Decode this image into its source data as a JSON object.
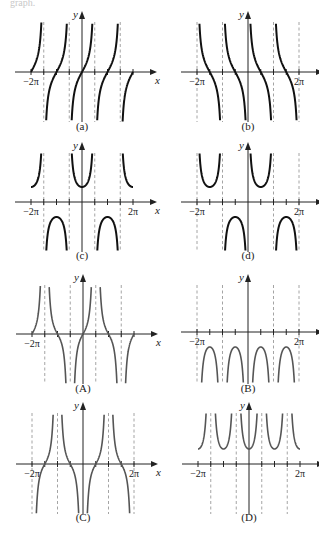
{
  "header_fragment": "graph.",
  "chart_data": [
    {
      "id": "a",
      "type": "line",
      "title": "(a)",
      "function": "tan",
      "xlabel": "x",
      "ylabel": "y",
      "xlim": [
        "-2π",
        "2π"
      ],
      "x_tick_labels": [
        "−2π"
      ],
      "asymptotes": [
        "-3π/2",
        "-π/2",
        "π/2",
        "3π/2"
      ],
      "zeros": [
        "-2π",
        "-π",
        "0",
        "π",
        "2π"
      ],
      "style": "dark"
    },
    {
      "id": "b",
      "type": "line",
      "title": "(b)",
      "function": "cot",
      "xlabel": "x",
      "ylabel": "y",
      "xlim": [
        "-2π",
        "2π"
      ],
      "x_tick_labels": [
        "−2π",
        "2π"
      ],
      "asymptotes": [
        "-2π",
        "-π",
        "0",
        "π",
        "2π"
      ],
      "zeros": [
        "-3π/2",
        "-π/2",
        "π/2",
        "3π/2"
      ],
      "style": "dark"
    },
    {
      "id": "c",
      "type": "line",
      "title": "(c)",
      "function": "sec",
      "xlabel": "x",
      "ylabel": "y",
      "xlim": [
        "-2π",
        "2π"
      ],
      "x_tick_labels": [
        "−2π",
        "2π"
      ],
      "asymptotes": [
        "-3π/2",
        "-π/2",
        "π/2",
        "3π/2"
      ],
      "local_extrema": [
        {
          "x": "0",
          "y": 1
        },
        {
          "x": "-π",
          "y": -1
        },
        {
          "x": "π",
          "y": -1
        },
        {
          "x": "-2π",
          "y": 1
        },
        {
          "x": "2π",
          "y": 1
        }
      ],
      "style": "dark"
    },
    {
      "id": "d",
      "type": "line",
      "title": "(d)",
      "function": "csc",
      "xlabel": "x",
      "ylabel": "y",
      "xlim": [
        "-2π",
        "2π"
      ],
      "x_tick_labels": [
        "−2π",
        "2π"
      ],
      "asymptotes": [
        "-2π",
        "-π",
        "0",
        "π",
        "2π"
      ],
      "local_extrema": [
        {
          "x": "-3π/2",
          "y": 1
        },
        {
          "x": "-π/2",
          "y": -1
        },
        {
          "x": "π/2",
          "y": 1
        },
        {
          "x": "3π/2",
          "y": -1
        }
      ],
      "style": "dark"
    },
    {
      "id": "A",
      "type": "line",
      "title": "(A)",
      "function": "sectan",
      "xlabel": "x",
      "ylabel": "y",
      "xlim": [
        "-2π",
        "2π"
      ],
      "x_tick_labels": [
        "−2π"
      ],
      "asymptotes": [
        "-3π/2",
        "-π/2",
        "π/2",
        "3π/2"
      ],
      "zeros": [
        "-2π",
        "-π",
        "0",
        "π",
        "2π"
      ],
      "style": "grey"
    },
    {
      "id": "B",
      "type": "line",
      "title": "(B)",
      "function": "negcsc2",
      "xlabel": "x",
      "ylabel": "y",
      "xlim": [
        "-2π",
        "2π"
      ],
      "x_tick_labels": [
        "−2π",
        "2π"
      ],
      "asymptotes": [
        "-2π",
        "-π",
        "0",
        "π",
        "2π"
      ],
      "local_extrema": [
        {
          "x": "-3π/2",
          "y": -1
        },
        {
          "x": "-π/2",
          "y": -1
        },
        {
          "x": "π/2",
          "y": -1
        },
        {
          "x": "3π/2",
          "y": -1
        }
      ],
      "style": "grey"
    },
    {
      "id": "C",
      "type": "line",
      "title": "(C)",
      "function": "negcsccot",
      "xlabel": "x",
      "ylabel": "y",
      "xlim": [
        "-2π",
        "2π"
      ],
      "x_tick_labels": [
        "−2π",
        "2π"
      ],
      "asymptotes": [
        "-2π",
        "-π",
        "0",
        "π",
        "2π"
      ],
      "zeros": [
        "-3π/2",
        "-π/2",
        "π/2",
        "3π/2"
      ],
      "style": "grey"
    },
    {
      "id": "D",
      "type": "line",
      "title": "(D)",
      "function": "sec2",
      "xlabel": "x",
      "ylabel": "y",
      "xlim": [
        "-2π",
        "2π"
      ],
      "x_tick_labels": [
        "−2π",
        "2π"
      ],
      "asymptotes": [
        "-3π/2",
        "-π/2",
        "π/2",
        "3π/2"
      ],
      "local_extrema": [
        {
          "x": "-2π",
          "y": 1
        },
        {
          "x": "-π",
          "y": 1
        },
        {
          "x": "0",
          "y": 1
        },
        {
          "x": "π",
          "y": 1
        },
        {
          "x": "2π",
          "y": 1
        }
      ],
      "style": "grey"
    }
  ]
}
